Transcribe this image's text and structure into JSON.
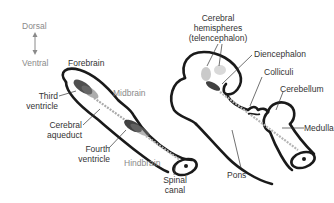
{
  "orientation": {
    "dorsal": "Dorsal",
    "ventral": "Ventral"
  },
  "regions": {
    "forebrain": "Forebrain",
    "midbrain": "Midbrain",
    "hindbrain": "Hindbrain"
  },
  "early_brain_labels": {
    "third_ventricle_line1": "Third",
    "third_ventricle_line2": "ventricle",
    "cerebral_aqueduct_line1": "Cerebral",
    "cerebral_aqueduct_line2": "aqueduct",
    "fourth_ventricle_line1": "Fourth",
    "fourth_ventricle_line2": "ventricle",
    "spinal_canal_line1": "Spinal",
    "spinal_canal_line2": "canal"
  },
  "later_brain_labels": {
    "cerebral_hemispheres_line1": "Cerebral",
    "cerebral_hemispheres_line2": "hemispheres",
    "cerebral_hemispheres_line3": "(telencephalon)",
    "diencephalon": "Diencephalon",
    "colliculi": "Colliculi",
    "cerebellum": "Cerebellum",
    "medulla": "Medulla",
    "pons": "Pons"
  },
  "colors": {
    "outline": "#1a1a1a",
    "label_text": "#333333",
    "region_text": "#8a8a8a",
    "ventricle_fill": "#555555",
    "canal_fill": "#b5b5b5"
  }
}
